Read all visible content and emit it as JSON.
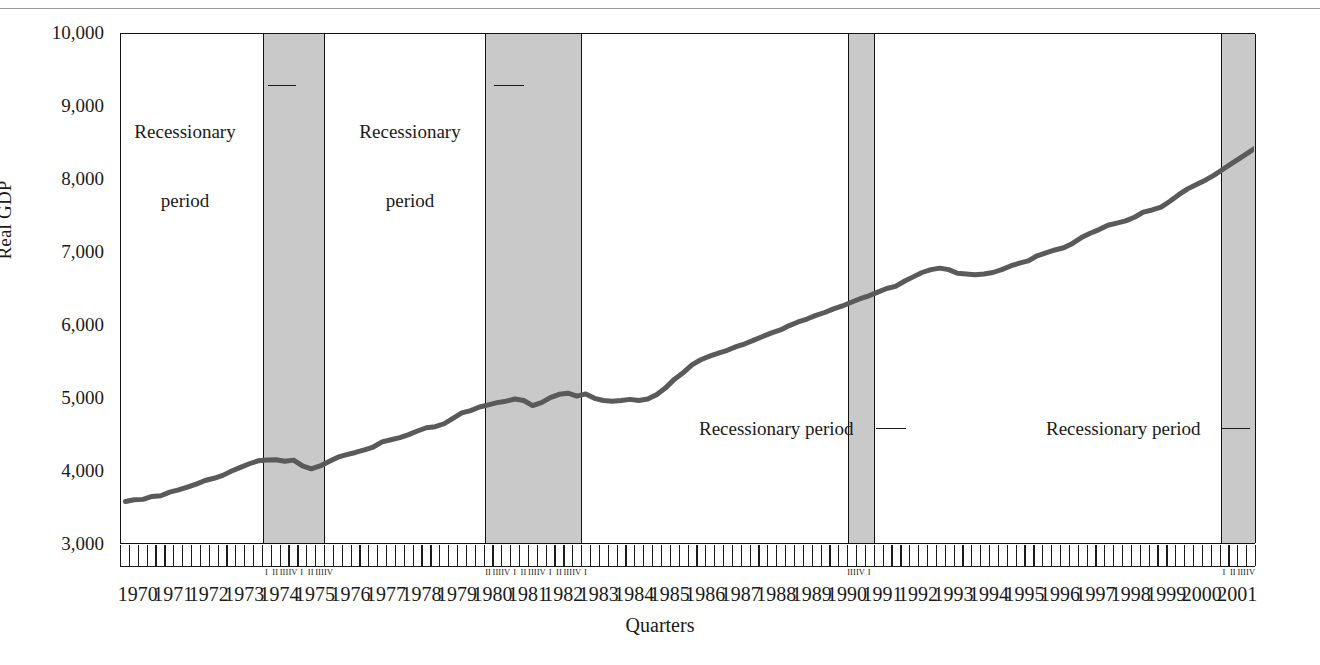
{
  "chart_data": {
    "type": "line",
    "title": "",
    "xlabel": "Quarters",
    "ylabel": "Real GDP",
    "ylim": [
      3000,
      10000
    ],
    "ytick_labels": [
      "10,000",
      "9,000",
      "8,000",
      "7,000",
      "6,000",
      "5,000",
      "4,000",
      "3,000"
    ],
    "ytick_values": [
      10000,
      9000,
      8000,
      7000,
      6000,
      5000,
      4000,
      3000
    ],
    "grid": false,
    "legend": "none",
    "x_start_year": 1970,
    "x_end_year": 2001,
    "x_unit": "quarter",
    "year_labels": [
      "1970",
      "1971",
      "1972",
      "1973",
      "1974",
      "1975",
      "1976",
      "1977",
      "1978",
      "1979",
      "1980",
      "1981",
      "1982",
      "1983",
      "1984",
      "1985",
      "1986",
      "1987",
      "1988",
      "1989",
      "1990",
      "1991",
      "1992",
      "1993",
      "1994",
      "1995",
      "1996",
      "1997",
      "1998",
      "1999",
      "2000",
      "2001"
    ],
    "series": [
      {
        "name": "Real GDP",
        "color": "#5a5a5a",
        "values": [
          3570,
          3595,
          3600,
          3640,
          3650,
          3700,
          3730,
          3770,
          3810,
          3860,
          3890,
          3930,
          3990,
          4040,
          4090,
          4130,
          4140,
          4145,
          4125,
          4140,
          4060,
          4020,
          4060,
          4120,
          4180,
          4215,
          4245,
          4280,
          4320,
          4390,
          4420,
          4450,
          4490,
          4540,
          4585,
          4600,
          4640,
          4715,
          4790,
          4820,
          4870,
          4900,
          4930,
          4950,
          4980,
          4960,
          4890,
          4930,
          5000,
          5045,
          5060,
          5020,
          5050,
          4990,
          4960,
          4950,
          4960,
          4975,
          4960,
          4980,
          5040,
          5130,
          5250,
          5340,
          5450,
          5520,
          5570,
          5610,
          5650,
          5700,
          5740,
          5790,
          5840,
          5890,
          5930,
          5990,
          6040,
          6080,
          6130,
          6170,
          6220,
          6260,
          6310,
          6360,
          6400,
          6450,
          6500,
          6530,
          6600,
          6660,
          6720,
          6760,
          6780,
          6760,
          6710,
          6700,
          6690,
          6700,
          6720,
          6760,
          6810,
          6850,
          6880,
          6950,
          6990,
          7030,
          7060,
          7120,
          7200,
          7260,
          7310,
          7370,
          7400,
          7430,
          7480,
          7550,
          7580,
          7620,
          7700,
          7790,
          7870,
          7930,
          7990,
          8060,
          8140,
          8220,
          8300,
          8380,
          8460,
          8540,
          8620,
          8700,
          8790,
          8870,
          8970,
          9060,
          9150,
          9230,
          9320,
          9390,
          9410,
          9420,
          9400,
          9410,
          9380,
          9400,
          9420,
          9430
        ]
      }
    ],
    "recession_bands": [
      {
        "label": "Recessionary period",
        "start_year": 1974.0,
        "end_year": 1975.75,
        "quarters": [
          "I",
          "II",
          "III",
          "IV",
          "I",
          "II",
          "III",
          "IV"
        ],
        "annotation_lines": [
          "Recessionary",
          "period"
        ]
      },
      {
        "label": "Recessionary period",
        "start_year": 1980.25,
        "end_year": 1983.0,
        "quarters": [
          "II",
          "III",
          "IV",
          "I",
          "II",
          "III",
          "IV",
          "I",
          "II",
          "III",
          "IV",
          "I"
        ],
        "annotation_lines": [
          "Recessionary",
          "period"
        ]
      },
      {
        "label": "Recessionary period",
        "start_year": 1990.5,
        "end_year": 1991.25,
        "quarters": [
          "III",
          "IV",
          "I"
        ],
        "annotation_lines": [
          "Recessionary period"
        ]
      },
      {
        "label": "Recessionary period",
        "start_year": 2001.0,
        "end_year": 2002.0,
        "quarters": [
          "I",
          "II",
          "III",
          "IV"
        ],
        "annotation_lines": [
          "Recessionary period"
        ]
      }
    ],
    "colors": {
      "line": "#5a5a5a",
      "band_fill": "#c9c9c9",
      "axis": "#111111",
      "text": "#1a1a1a"
    }
  },
  "annotations": {
    "a1_line1": "Recessionary",
    "a1_line2": "period",
    "a2_line1": "Recessionary",
    "a2_line2": "period",
    "a3": "Recessionary period",
    "a4": "Recessionary period"
  },
  "axes": {
    "y_title": "Real GDP",
    "x_title": "Quarters"
  }
}
